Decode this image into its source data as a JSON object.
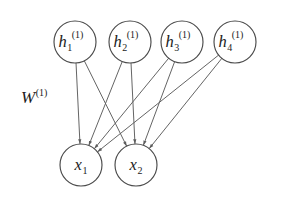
{
  "figure": {
    "type": "neural-network-bipartite-graph",
    "title": "",
    "background_color": "#ffffff",
    "stroke_color": "#5c5c5c",
    "node_stroke_color": "#4a4a4a",
    "text_color": "#1c1c1c"
  },
  "weight_label": {
    "base": "W",
    "superscript": "(1)",
    "full_text": "W(1)",
    "x": 21,
    "y": 103
  },
  "layers": {
    "hidden": {
      "name": "hidden-layer",
      "radius": 21,
      "cy": 42,
      "nodes": [
        {
          "id": "h1",
          "base": "h",
          "subscript": "1",
          "superscript": "(1)",
          "cx": 75
        },
        {
          "id": "h2",
          "base": "h",
          "subscript": "2",
          "superscript": "(1)",
          "cx": 130
        },
        {
          "id": "h3",
          "base": "h",
          "subscript": "3",
          "superscript": "(1)",
          "cx": 182
        },
        {
          "id": "h4",
          "base": "h",
          "subscript": "4",
          "superscript": "(1)",
          "cx": 235
        }
      ]
    },
    "input": {
      "name": "input-layer",
      "radius": 21,
      "cy": 165,
      "nodes": [
        {
          "id": "x1",
          "base": "x",
          "subscript": "1",
          "superscript": "",
          "cx": 81
        },
        {
          "id": "x2",
          "base": "x",
          "subscript": "2",
          "superscript": "",
          "cx": 136
        }
      ]
    }
  },
  "edges": [
    {
      "from": "h1",
      "to": "x1"
    },
    {
      "from": "h1",
      "to": "x2"
    },
    {
      "from": "h2",
      "to": "x1"
    },
    {
      "from": "h2",
      "to": "x2"
    },
    {
      "from": "h3",
      "to": "x1"
    },
    {
      "from": "h3",
      "to": "x2"
    },
    {
      "from": "h4",
      "to": "x1"
    },
    {
      "from": "h4",
      "to": "x2"
    }
  ]
}
